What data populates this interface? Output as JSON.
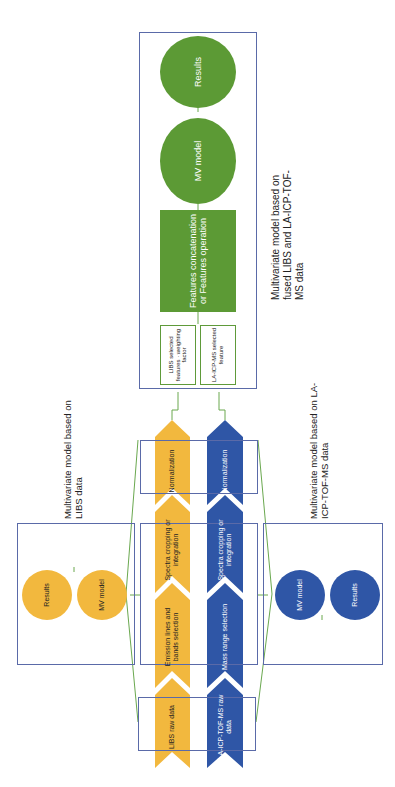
{
  "diagram": {
    "orientation": "rotated -90deg (reads bottom to top)",
    "colors": {
      "libs": "#f2b83e",
      "icpms": "#2f56a6",
      "fusion": "#5c9a35",
      "frame": "#5a6aa8",
      "connector": "#6aa84f"
    },
    "libs_pipeline": {
      "steps": [
        "LIBS raw data",
        "Emission lines and bands selection",
        "Spectra cropping or integration",
        "Normalization"
      ]
    },
    "icpms_pipeline": {
      "steps": [
        "LA-ICP-TOF-MS raw data",
        "Mass range selection",
        "Spectra cropping or integration",
        "Normalization"
      ]
    },
    "libs_model": {
      "caption": "Multivariate model based on LIBS data",
      "mv_model": "MV model",
      "results": "Results"
    },
    "icpms_model": {
      "caption": "Multivariate model based on LA-ICP-TOF-MS data",
      "mv_model": "MV model",
      "results": "Results"
    },
    "fusion_model": {
      "caption": "Multivariate model based on fused LIBS and LA-ICP-TOF-MS data",
      "libs_features": "LIBS selected features · weighting factor",
      "icpms_features": "LA-ICP-MS selected feature",
      "operation": "Features concatenation or Features operation",
      "mv_model": "MV model",
      "results": "Results"
    }
  }
}
